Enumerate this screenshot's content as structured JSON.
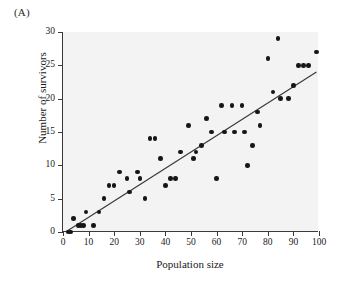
{
  "figure": {
    "panel_label": "(A)",
    "background_color": "#f3f3f3",
    "point_color": "#161616",
    "line_color": "#3a3a3a"
  },
  "chart_data": {
    "type": "scatter",
    "title": "(A)",
    "xlabel": "Population size",
    "ylabel": "Number of survivors",
    "xlim": [
      0,
      100
    ],
    "ylim": [
      0,
      30
    ],
    "xticks": [
      0,
      10,
      20,
      30,
      40,
      50,
      60,
      70,
      80,
      90,
      100
    ],
    "yticks": [
      0,
      5,
      10,
      15,
      20,
      25,
      30
    ],
    "grid": false,
    "legend": null,
    "series": [
      {
        "name": "survivors",
        "marker": "filled-circle",
        "points": [
          [
            2,
            0
          ],
          [
            3,
            0
          ],
          [
            4,
            2
          ],
          [
            6,
            1
          ],
          [
            7,
            1
          ],
          [
            8,
            1
          ],
          [
            9,
            3
          ],
          [
            12,
            1
          ],
          [
            14,
            3
          ],
          [
            16,
            5
          ],
          [
            18,
            7
          ],
          [
            20,
            7
          ],
          [
            22,
            9
          ],
          [
            25,
            8
          ],
          [
            26,
            6
          ],
          [
            29,
            9
          ],
          [
            30,
            8
          ],
          [
            32,
            5
          ],
          [
            34,
            14
          ],
          [
            36,
            14
          ],
          [
            38,
            11
          ],
          [
            40,
            7
          ],
          [
            42,
            8
          ],
          [
            44,
            8
          ],
          [
            46,
            12
          ],
          [
            49,
            16
          ],
          [
            51,
            11
          ],
          [
            52,
            12
          ],
          [
            54,
            13
          ],
          [
            56,
            17
          ],
          [
            58,
            15
          ],
          [
            60,
            8
          ],
          [
            62,
            19
          ],
          [
            63,
            15
          ],
          [
            66,
            19
          ],
          [
            67,
            15
          ],
          [
            70,
            19
          ],
          [
            71,
            15
          ],
          [
            72,
            10
          ],
          [
            74,
            13
          ],
          [
            76,
            18
          ],
          [
            77,
            16
          ],
          [
            80,
            26
          ],
          [
            82,
            21
          ],
          [
            84,
            29
          ],
          [
            85,
            20
          ],
          [
            88,
            20
          ],
          [
            90,
            22
          ],
          [
            92,
            25
          ],
          [
            94,
            25
          ],
          [
            96,
            25
          ],
          [
            99,
            27
          ]
        ]
      }
    ],
    "trendline": {
      "type": "linear-fit",
      "x_start": 1,
      "y_start": 0,
      "x_end": 99,
      "y_end": 24
    }
  }
}
